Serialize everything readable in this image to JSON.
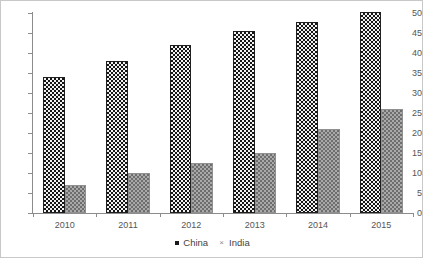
{
  "chart_data": {
    "type": "bar",
    "title": "",
    "subtitle": "",
    "xlabel": "",
    "ylabel": "",
    "categories": [
      "2010",
      "2011",
      "2012",
      "2013",
      "2014",
      "2015"
    ],
    "series": [
      {
        "name": "China",
        "values": [
          34,
          38,
          42,
          45.5,
          47.8,
          50.3
        ],
        "color": "#151515",
        "pattern": "dotted-dark"
      },
      {
        "name": "India",
        "values": [
          7,
          10,
          12.5,
          15,
          21,
          26
        ],
        "color": "#a9a9a9",
        "pattern": "checker-gray"
      }
    ],
    "ylim": [
      0,
      50
    ],
    "yticks": [
      0,
      5,
      10,
      15,
      20,
      25,
      30,
      35,
      40,
      45,
      50
    ],
    "ytick_labels": [
      "0",
      "5",
      "10",
      "15",
      "20",
      "25",
      "30",
      "35",
      "40",
      "45",
      "50"
    ],
    "grid": false,
    "legend_position": "bottom"
  },
  "legend": {
    "china_label": "China",
    "india_label": "India",
    "india_marker": "×"
  },
  "yticks": {
    "t0": "0",
    "t1": "5",
    "t2": "10",
    "t3": "15",
    "t4": "20",
    "t5": "25",
    "t6": "30",
    "t7": "35",
    "t8": "40",
    "t9": "45",
    "t10": "50"
  },
  "xticks": {
    "c0": "2010",
    "c1": "2011",
    "c2": "2012",
    "c3": "2013",
    "c4": "2014",
    "c5": "2015"
  }
}
